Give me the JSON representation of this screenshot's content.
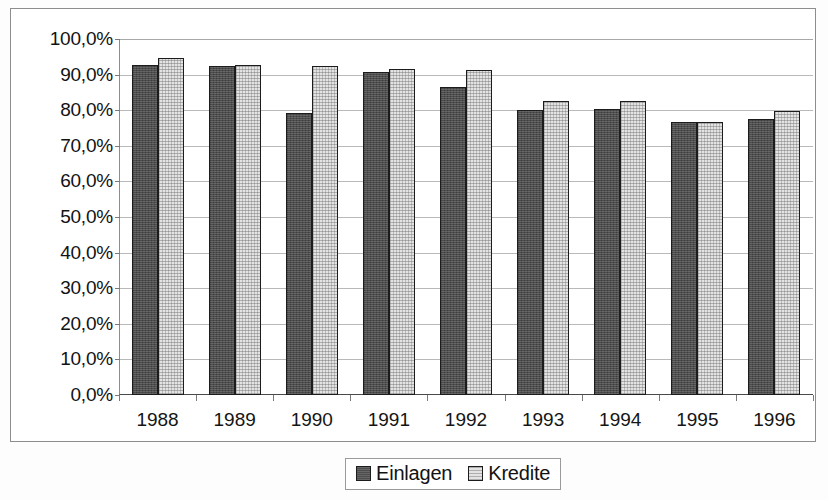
{
  "chart_data": {
    "type": "bar",
    "title": "",
    "subtitle": "",
    "xlabel": "",
    "ylabel": "",
    "categories": [
      "1988",
      "1989",
      "1990",
      "1991",
      "1992",
      "1993",
      "1994",
      "1995",
      "1996"
    ],
    "series": [
      {
        "name": "Einlagen",
        "color": "#4d4d4d",
        "values": [
          92.8,
          92.3,
          79.3,
          90.6,
          86.4,
          80.2,
          80.4,
          76.6,
          77.4
        ]
      },
      {
        "name": "Kredite",
        "color": "#e3e3e3",
        "values": [
          94.6,
          92.6,
          92.5,
          91.5,
          91.4,
          82.5,
          82.5,
          76.7,
          79.9
        ]
      }
    ],
    "ylim": [
      0,
      100
    ],
    "ytick_values": [
      0,
      10,
      20,
      30,
      40,
      50,
      60,
      70,
      80,
      90,
      100
    ],
    "ytick_labels": [
      "0,0%",
      "10,0%",
      "20,0%",
      "30,0%",
      "40,0%",
      "50,0%",
      "60,0%",
      "70,0%",
      "80,0%",
      "90,0%",
      "100,0%"
    ],
    "grid": true,
    "grid_axis": "y",
    "legend": {
      "position": "bottom",
      "bordered": true,
      "entries": [
        "Einlagen",
        "Kredite"
      ]
    },
    "annotations": []
  },
  "colors": {
    "series_einlagen": "#4d4d4d",
    "series_kredite": "#e3e3e3",
    "bar_outline": "#1c1c1c",
    "gridline": "#b9b9b9",
    "axis": "#4a4a4a",
    "frame": "#8d8d8d",
    "text": "#121212",
    "background": "#ffffff"
  }
}
